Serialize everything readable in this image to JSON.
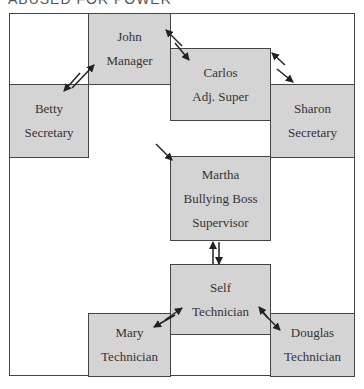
{
  "heading": "ABUSED FOR POWER",
  "nodes": {
    "john": {
      "name": "John",
      "role": "Manager"
    },
    "carlos": {
      "name": "Carlos",
      "role": "Adj. Super"
    },
    "betty": {
      "name": "Betty",
      "role": "Secretary"
    },
    "sharon": {
      "name": "Sharon",
      "role": "Secretary"
    },
    "martha": {
      "name": "Martha",
      "role": "Bullying Boss",
      "role2": "Supervisor"
    },
    "self": {
      "name": "Self",
      "role": "Technician"
    },
    "mary": {
      "name": "Mary",
      "role": "Technician"
    },
    "douglas": {
      "name": "Douglas",
      "role": "Technician"
    }
  },
  "colors": {
    "box_fill": "#d4d4d4",
    "border": "#444444",
    "arrow": "#222222"
  }
}
